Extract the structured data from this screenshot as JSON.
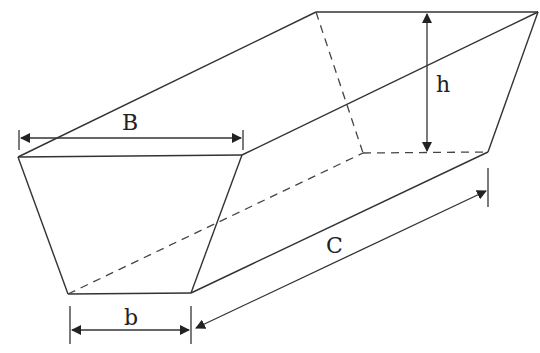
{
  "diagram": {
    "labels": {
      "top_width": "B",
      "bottom_width": "b",
      "height": "h",
      "length": "C"
    },
    "colors": {
      "line": "#333333",
      "background": "#ffffff"
    }
  }
}
